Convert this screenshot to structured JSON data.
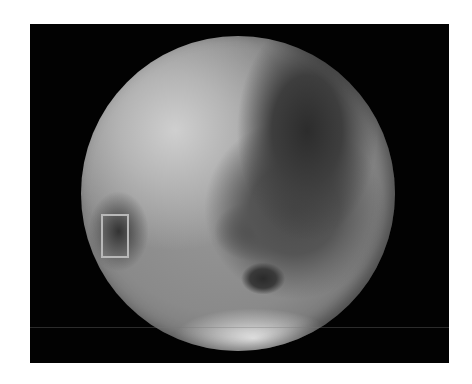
{
  "image": {
    "subject": "Grayscale global view of a planetary body",
    "background_color": "#020202",
    "page_color": "#ffffff",
    "highlight_box": {
      "label": "highlighted region",
      "color": "#b8b8b8"
    }
  }
}
